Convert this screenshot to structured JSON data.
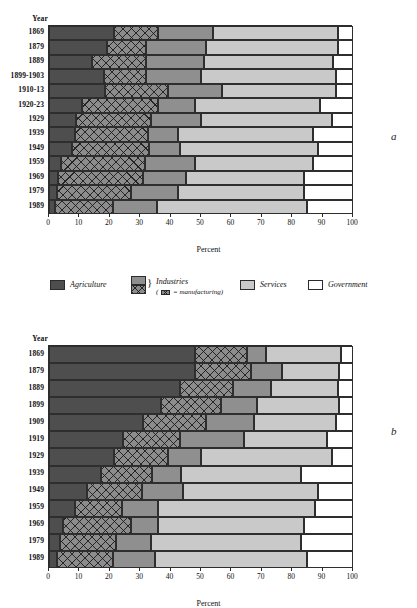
{
  "figure": {
    "panel_a_letter": "a",
    "panel_b_letter": "b",
    "year_header": "Year",
    "axis_title": "Percent"
  },
  "legend": {
    "items": [
      {
        "key": "agriculture",
        "label": "Agriculture",
        "color": "#4e4e4e"
      },
      {
        "key": "industries",
        "label": "Industries",
        "color": "#8f8f8f"
      },
      {
        "key": "services",
        "label": "Services",
        "color": "#c9c9c9"
      },
      {
        "key": "government",
        "label": "Government",
        "color": "#ffffff"
      }
    ],
    "industries_note": "( = manufacturing)",
    "industries_note_prefix": "(",
    "industries_note_suffix": "= manufacturing)"
  },
  "chart_data": [
    {
      "id": "panel-a",
      "type": "bar",
      "orientation": "horizontal",
      "stacked": true,
      "title": "a",
      "xlabel": "Percent",
      "ylabel": "Year",
      "xlim": [
        0,
        100
      ],
      "xticks": [
        0,
        10,
        20,
        30,
        40,
        50,
        60,
        70,
        80,
        90,
        100
      ],
      "xticklabels": [
        "0",
        "10",
        "20",
        "30",
        "40",
        "50",
        "60",
        "70",
        "80",
        "90",
        "100"
      ],
      "grid": false,
      "legend_position": "below",
      "categories": [
        "1869",
        "1879",
        "1889",
        "1899-1903",
        "1910-13",
        "1920-23",
        "1929",
        "1939",
        "1949",
        "1959",
        "1969",
        "1979",
        "1989"
      ],
      "series": [
        {
          "name": "Agriculture",
          "fill": "#4e4e4e",
          "hatch": "none",
          "values": [
            21.5,
            19.0,
            14.0,
            18.0,
            18.5,
            11.0,
            9.0,
            8.5,
            7.5,
            4.0,
            3.0,
            2.5,
            2.0
          ]
        },
        {
          "name": "Manufacturing",
          "fill": "#8c8c8c",
          "hatch": "crosshatch",
          "values": [
            14.5,
            13.0,
            18.0,
            14.0,
            20.5,
            25.0,
            24.5,
            24.0,
            25.5,
            27.5,
            28.0,
            24.5,
            19.0
          ]
        },
        {
          "name": "Other industries",
          "fill": "#8f8f8f",
          "hatch": "none",
          "values": [
            18.0,
            19.5,
            19.0,
            18.0,
            18.0,
            12.0,
            16.5,
            10.0,
            10.0,
            16.5,
            14.0,
            15.5,
            14.5
          ]
        },
        {
          "name": "Services",
          "fill": "#c9c9c9",
          "hatch": "none",
          "values": [
            41.0,
            43.5,
            42.5,
            44.5,
            37.5,
            41.0,
            43.0,
            44.5,
            45.5,
            39.0,
            39.0,
            41.5,
            49.5
          ]
        },
        {
          "name": "Government",
          "fill": "#ffffff",
          "hatch": "none",
          "values": [
            5.0,
            5.0,
            6.5,
            5.5,
            5.5,
            11.0,
            7.0,
            13.0,
            11.5,
            13.0,
            16.0,
            16.0,
            15.0
          ]
        }
      ]
    },
    {
      "id": "panel-b",
      "type": "bar",
      "orientation": "horizontal",
      "stacked": true,
      "title": "b",
      "xlabel": "Percent",
      "ylabel": "Year",
      "xlim": [
        0,
        100
      ],
      "xticks": [
        0,
        10,
        20,
        30,
        40,
        50,
        60,
        70,
        80,
        90,
        100
      ],
      "xticklabels": [
        "0",
        "10",
        "20",
        "30",
        "40",
        "50",
        "60",
        "70",
        "80",
        "90",
        "100"
      ],
      "grid": false,
      "legend_position": "above",
      "categories": [
        "1869",
        "1879",
        "1889",
        "1899",
        "1909",
        "1919",
        "1929",
        "1939",
        "1949",
        "1959",
        "1969",
        "1979",
        "1989"
      ],
      "series": [
        {
          "name": "Agriculture",
          "fill": "#4e4e4e",
          "hatch": "none",
          "values": [
            48.0,
            48.0,
            43.0,
            37.0,
            31.0,
            24.5,
            21.5,
            17.0,
            12.5,
            8.5,
            4.5,
            3.5,
            2.5
          ]
        },
        {
          "name": "Manufacturing",
          "fill": "#8c8c8c",
          "hatch": "crosshatch",
          "values": [
            17.0,
            18.5,
            17.5,
            19.5,
            20.5,
            18.5,
            17.5,
            17.0,
            18.0,
            15.5,
            22.5,
            18.5,
            18.5
          ]
        },
        {
          "name": "Other industries",
          "fill": "#8f8f8f",
          "hatch": "none",
          "values": [
            6.5,
            10.0,
            12.5,
            12.0,
            16.0,
            21.0,
            11.0,
            9.5,
            13.5,
            12.0,
            9.0,
            11.5,
            14.0
          ]
        },
        {
          "name": "Services",
          "fill": "#c9c9c9",
          "hatch": "none",
          "values": [
            24.5,
            19.0,
            22.0,
            27.0,
            27.0,
            27.5,
            43.0,
            39.5,
            44.5,
            51.5,
            48.0,
            49.5,
            50.0
          ]
        },
        {
          "name": "Government",
          "fill": "#ffffff",
          "hatch": "none",
          "values": [
            4.0,
            4.5,
            5.0,
            4.5,
            5.5,
            8.5,
            7.0,
            17.0,
            11.5,
            12.5,
            16.0,
            17.0,
            15.0
          ]
        }
      ]
    }
  ]
}
